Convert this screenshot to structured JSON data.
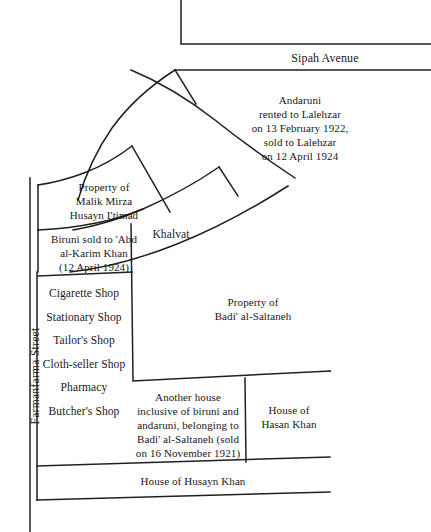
{
  "figure": {
    "kind": "property-plan-diagram",
    "background_color": "#ffffff",
    "line_color": "#1f1f1f"
  },
  "streets": {
    "sipah_avenue": "Sipah Avenue",
    "farmanfarma_street": "Farmanfarma Street"
  },
  "places": {
    "hasanabad_maydan": "Hasanabad\nMaydan",
    "mihan_cinema": "Mihan\nCinema",
    "khalvat": "Khalvat"
  },
  "parcels": {
    "houses_sayyid": "Houses of\nSayyid Isma'il and\nShaykh al-'Iraqayn's\nwife",
    "andaruni": "Andaruni\nrented to Lalehzar\non 13 February 1922,\nsold to Lalehzar\non 12 April 1924",
    "malik_mirza": "Property of\nMalik Mirza\nHusayn I'timad",
    "biruni": "Biruni sold to 'Abd\nal-Karim Khan\n(12 April 1924)",
    "badi_al_saltaneh": "Property of\nBadi' al-Saltaneh",
    "another_house": "Another house\ninclusive of biruni and\nandaruni, belonging to\nBadi' al-Saltaneh (sold\non 16 November 1921)",
    "hasan_khan": "House of\nHasan Khan",
    "husayn_khan": "House of Husayn Khan"
  },
  "shops": {
    "items": [
      "Cigarette Shop",
      "Stationary Shop",
      "Tailor's Shop",
      "Cloth-seller Shop",
      "Pharmacy",
      "Butcher's Shop"
    ]
  },
  "arc_labels": {
    "hasanabad_maydan_chars": "Hasanabad",
    "hasanabad_maydan_chars2": "Maydan",
    "mihan_chars": "Mihan",
    "cinema_chars": "Cinema"
  }
}
